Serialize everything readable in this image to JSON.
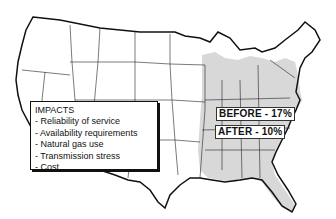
{
  "map": {
    "type": "us-states-outline",
    "highlighted_region": "eastern-us",
    "highlight_color": "#d8d8d8",
    "outline_color": "#111111"
  },
  "legend": {
    "title": "IMPACTS",
    "items": [
      "- Reliability of service",
      "- Availability requirements",
      "- Natural gas use",
      "- Transmission stress",
      "- Cost"
    ]
  },
  "labels": {
    "before": "BEFORE - 17%",
    "after": "AFTER - 10%"
  }
}
